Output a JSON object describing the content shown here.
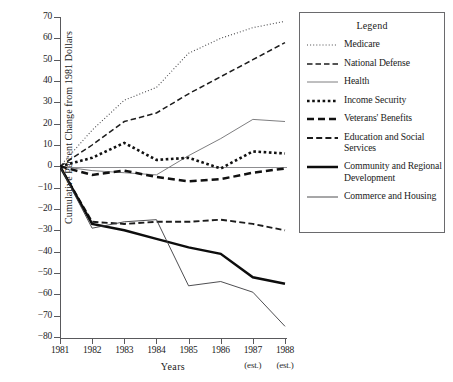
{
  "chart_data": {
    "type": "line",
    "title": "",
    "xlabel": "Years",
    "ylabel": "Cumulative Percent Change from 1981 Dollars",
    "x": [
      "1981",
      "1982",
      "1983",
      "1984",
      "1985",
      "1986",
      "1987",
      "1988"
    ],
    "x_annotations": [
      "",
      "",
      "",
      "",
      "",
      "",
      "(est.)",
      "(est.)"
    ],
    "xlim": [
      1981,
      1988
    ],
    "ylim": [
      -80,
      70
    ],
    "ytick_values": [
      70,
      60,
      50,
      40,
      30,
      20,
      10,
      0,
      -10,
      -20,
      -30,
      -40,
      -50,
      -60,
      -70,
      -80
    ],
    "ytick_labels": [
      "70",
      "60",
      "50",
      "40",
      "30",
      "20",
      "10",
      "0",
      "−10",
      "−20",
      "−30",
      "−40",
      "−50",
      "−60",
      "−70",
      "−80"
    ],
    "grid": false,
    "zero_line": true,
    "legend_position": "right",
    "legend_title": "Legend",
    "series": [
      {
        "name": "Medicare",
        "style": "dotted-fine",
        "values": [
          0,
          17,
          31,
          37,
          53,
          60,
          65,
          68
        ]
      },
      {
        "name": "National Defense",
        "style": "dashed-medium",
        "values": [
          0,
          10,
          21,
          25,
          34,
          42,
          50,
          58
        ]
      },
      {
        "name": "Health",
        "style": "solid-thin-gray",
        "values": [
          0,
          -2,
          -3,
          -4,
          5,
          13,
          22,
          21
        ]
      },
      {
        "name": "Income Security",
        "style": "dotted-heavy",
        "values": [
          0,
          4,
          11,
          3,
          4,
          -1,
          7,
          6
        ]
      },
      {
        "name": "Veterans' Benefits",
        "style": "dashed-heavy",
        "values": [
          0,
          -4,
          -2,
          -5,
          -7,
          -6,
          -3,
          -1
        ]
      },
      {
        "name": "Education and Social Services",
        "style": "dashed-fine-long",
        "values": [
          0,
          -26,
          -27,
          -26,
          -26,
          -25,
          -27,
          -30
        ]
      },
      {
        "name": "Community and Regional Development",
        "style": "solid-thick",
        "values": [
          0,
          -27,
          -30,
          -34,
          -38,
          -41,
          -52,
          -55
        ]
      },
      {
        "name": "Commerce and Housing",
        "style": "solid-thin",
        "values": [
          0,
          -29,
          -26,
          -25,
          -56,
          -54,
          -59,
          -75
        ]
      }
    ]
  }
}
